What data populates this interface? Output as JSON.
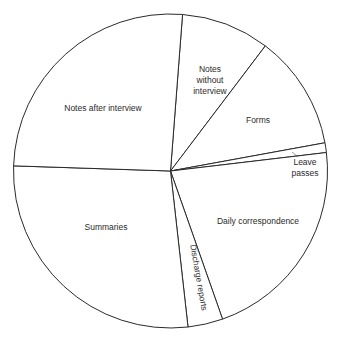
{
  "chart_data": {
    "type": "pie",
    "title": "",
    "start_angle_deg_clockwise_from_top": 4.4,
    "direction": "clockwise",
    "categories": [
      "Notes without interview",
      "Forms",
      "Leave passes",
      "Daily correspondence",
      "Discharge reports",
      "Summaries",
      "Notes after interview"
    ],
    "values": [
      9.1,
      11.8,
      1.0,
      21.5,
      3.6,
      27.3,
      25.7
    ],
    "units": "percent (estimated from slice angles)",
    "legend": "none (labels inside slices)",
    "labels": {
      "notes_without_interview": [
        "Notes",
        "without",
        "interview"
      ],
      "forms": "Forms",
      "leave_passes": [
        "Leave",
        "passes"
      ],
      "daily_correspondence": "Daily correspondence",
      "discharge_reports": "Discharge reports",
      "summaries": "Summaries",
      "notes_after_interview": "Notes after interview"
    },
    "colors": {
      "fill": "#ffffff",
      "stroke": "#2a2a2a",
      "text": "#2a2a2a"
    }
  }
}
